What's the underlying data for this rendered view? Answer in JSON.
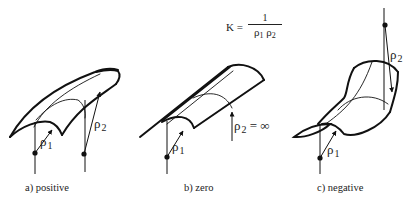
{
  "formula": {
    "lhs": "K =",
    "numerator": "1",
    "denominator_parts": [
      "ρ",
      "1",
      "ρ",
      "2"
    ]
  },
  "panels": [
    {
      "id": "a",
      "caption": "a)  positive",
      "rho1": {
        "symbol": "ρ",
        "sub": "1"
      },
      "rho2": {
        "symbol": "ρ",
        "sub": "2",
        "suffix": ""
      }
    },
    {
      "id": "b",
      "caption": "b)   zero",
      "rho1": {
        "symbol": "ρ",
        "sub": "1"
      },
      "rho2": {
        "symbol": "ρ",
        "sub": "2",
        "suffix": " = ∞"
      }
    },
    {
      "id": "c",
      "caption": "c)   negative",
      "rho1": {
        "symbol": "ρ",
        "sub": "1"
      },
      "rho2": {
        "symbol": "ρ",
        "sub": "2",
        "suffix": ""
      }
    }
  ],
  "colors": {
    "ink": "#111111",
    "background": "#ffffff"
  }
}
